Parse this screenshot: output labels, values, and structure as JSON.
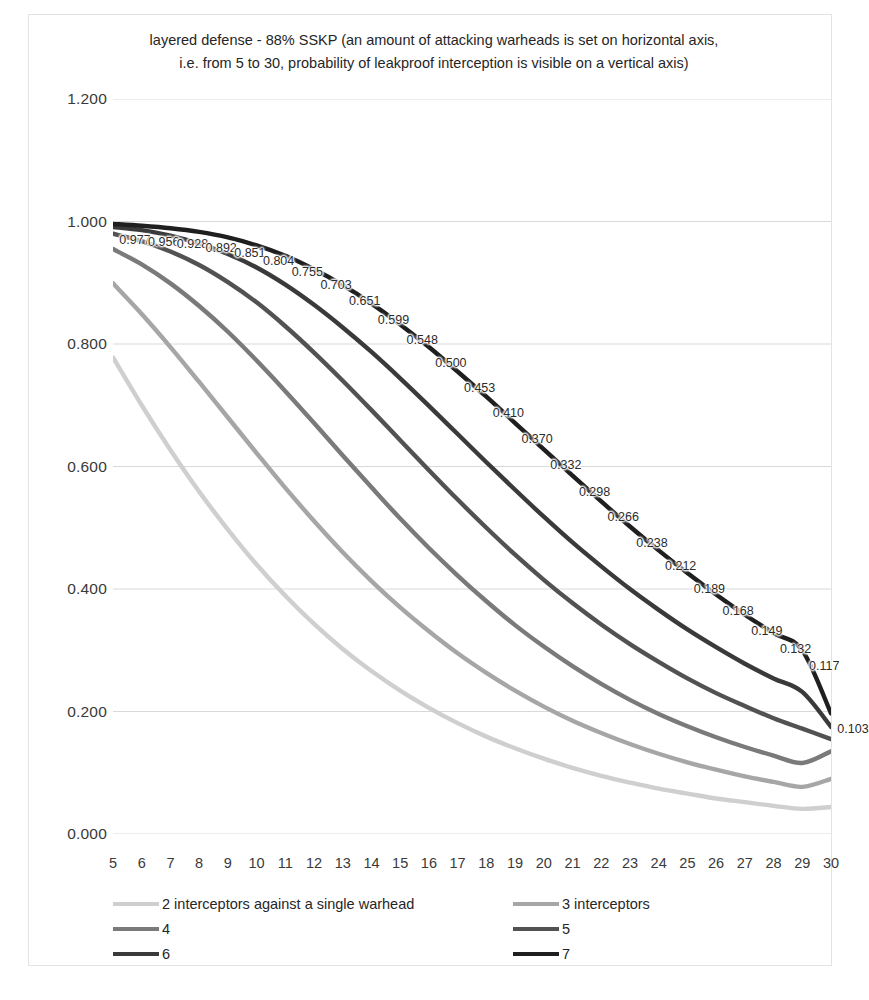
{
  "chart_data": {
    "type": "line",
    "title": "layered defense - 88% SSKP (an amount of attacking warheads is set on horizontal axis,\ni.e. from 5 to 30, probability of leakproof interception is visible on a vertical axis)",
    "xlabel": "",
    "ylabel": "",
    "xlim": [
      5,
      30
    ],
    "ylim": [
      0.0,
      1.2
    ],
    "grid": true,
    "legend_position": "bottom",
    "x": [
      5,
      6,
      7,
      8,
      9,
      10,
      11,
      12,
      13,
      14,
      15,
      16,
      17,
      18,
      19,
      20,
      21,
      22,
      23,
      24,
      25,
      26,
      27,
      28,
      29,
      30
    ],
    "x_tick_labels": [
      "5",
      "6",
      "7",
      "8",
      "9",
      "10",
      "11",
      "12",
      "13",
      "14",
      "15",
      "16",
      "17",
      "18",
      "19",
      "20",
      "21",
      "22",
      "23",
      "24",
      "25",
      "26",
      "27",
      "28",
      "29",
      "30"
    ],
    "y_tick_labels": [
      "1.200",
      "1.000",
      "0.800",
      "0.600",
      "0.400",
      "0.200",
      "0.000"
    ],
    "y_tick_values": [
      1.2,
      1.0,
      0.8,
      0.6,
      0.4,
      0.2,
      0.0
    ],
    "series": [
      {
        "name": "2 interceptors against a single warhead",
        "color": "#cfcfcf",
        "values": [
          0.778,
          0.7,
          0.627,
          0.559,
          0.497,
          0.44,
          0.389,
          0.343,
          0.302,
          0.266,
          0.234,
          0.206,
          0.181,
          0.159,
          0.14,
          0.123,
          0.108,
          0.095,
          0.084,
          0.074,
          0.066,
          0.058,
          0.052,
          0.046,
          0.041,
          0.044
        ]
      },
      {
        "name": "3 interceptors",
        "color": "#a6a6a6",
        "values": [
          0.899,
          0.849,
          0.795,
          0.738,
          0.68,
          0.622,
          0.565,
          0.511,
          0.46,
          0.413,
          0.37,
          0.331,
          0.295,
          0.263,
          0.234,
          0.208,
          0.185,
          0.165,
          0.147,
          0.131,
          0.117,
          0.105,
          0.094,
          0.085,
          0.077,
          0.09
        ]
      },
      {
        "name": "4",
        "color": "#7a7a7a",
        "values": [
          0.955,
          0.93,
          0.899,
          0.862,
          0.82,
          0.773,
          0.723,
          0.671,
          0.618,
          0.566,
          0.515,
          0.467,
          0.422,
          0.38,
          0.341,
          0.306,
          0.274,
          0.245,
          0.219,
          0.196,
          0.176,
          0.158,
          0.142,
          0.128,
          0.116,
          0.135
        ]
      },
      {
        "name": "5",
        "color": "#525252",
        "values": [
          0.98,
          0.968,
          0.951,
          0.929,
          0.901,
          0.868,
          0.829,
          0.786,
          0.74,
          0.692,
          0.643,
          0.594,
          0.546,
          0.5,
          0.456,
          0.415,
          0.377,
          0.342,
          0.31,
          0.281,
          0.254,
          0.23,
          0.209,
          0.189,
          0.172,
          0.155
        ]
      },
      {
        "name": "6",
        "color": "#3a3a3a",
        "values": [
          0.991,
          0.986,
          0.977,
          0.964,
          0.947,
          0.925,
          0.897,
          0.864,
          0.827,
          0.787,
          0.744,
          0.699,
          0.653,
          0.607,
          0.562,
          0.518,
          0.476,
          0.437,
          0.4,
          0.366,
          0.334,
          0.305,
          0.278,
          0.254,
          0.232,
          0.175
        ]
      },
      {
        "name": "7",
        "color": "#1f1f1f",
        "values": [
          0.996,
          0.993,
          0.989,
          0.983,
          0.974,
          0.961,
          0.944,
          0.922,
          0.896,
          0.866,
          0.832,
          0.795,
          0.755,
          0.714,
          0.671,
          0.628,
          0.585,
          0.543,
          0.502,
          0.463,
          0.426,
          0.391,
          0.358,
          0.328,
          0.3,
          0.197
        ]
      }
    ],
    "data_labels": {
      "series": "7",
      "x": [
        5,
        6,
        7,
        8,
        9,
        10,
        11,
        12,
        13,
        14,
        15,
        16,
        17,
        18,
        19,
        20,
        21,
        22,
        23,
        24,
        25,
        26,
        27,
        28,
        29,
        30
      ],
      "values": [
        "0.977",
        "0.956",
        "0.928",
        "0.892",
        "0.851",
        "0.804",
        "0.755",
        "0.703",
        "0.651",
        "0.599",
        "0.548",
        "0.500",
        "0.453",
        "0.410",
        "0.370",
        "0.332",
        "0.298",
        "0.266",
        "0.238",
        "0.212",
        "0.189",
        "0.168",
        "0.149",
        "0.132",
        "0.117",
        "0.103"
      ],
      "numeric": [
        0.977,
        0.956,
        0.928,
        0.892,
        0.851,
        0.804,
        0.755,
        0.703,
        0.651,
        0.599,
        0.548,
        0.5,
        0.453,
        0.41,
        0.37,
        0.332,
        0.298,
        0.266,
        0.238,
        0.212,
        0.189,
        0.168,
        0.149,
        0.132,
        0.117,
        0.103
      ]
    }
  },
  "legend": {
    "items": [
      {
        "label": "2 interceptors against a single warhead",
        "color": "#cfcfcf"
      },
      {
        "label": "3 interceptors",
        "color": "#a6a6a6"
      },
      {
        "label": "4",
        "color": "#7a7a7a"
      },
      {
        "label": "5",
        "color": "#525252"
      },
      {
        "label": "6",
        "color": "#3a3a3a"
      },
      {
        "label": "7",
        "color": "#1f1f1f"
      }
    ]
  },
  "colors": {
    "grid": "#d9d9d9",
    "frame": "#e3e3e3",
    "text": "#262626",
    "background": "#ffffff"
  }
}
